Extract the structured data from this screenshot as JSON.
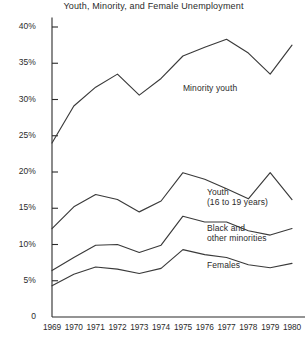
{
  "chart_data": {
    "type": "line",
    "title": "Youth, Minority, and Female Unemployment",
    "xlabel": "",
    "ylabel": "",
    "x": [
      1969,
      1970,
      1971,
      1972,
      1973,
      1974,
      1975,
      1976,
      1977,
      1978,
      1979,
      1980
    ],
    "categories": [
      "1969",
      "1970",
      "1971",
      "1972",
      "1973",
      "1974",
      "1975",
      "1976",
      "1977",
      "1978",
      "1979",
      "1980"
    ],
    "xtick_labels": [
      "1969",
      "1970",
      "1971",
      "1972",
      "1973",
      "1974",
      "1975",
      "1976",
      "1977",
      "1978",
      "1979",
      "1980"
    ],
    "ytick_labels": [
      "0",
      "5%",
      "10%",
      "15%",
      "20%",
      "25%",
      "30%",
      "35%",
      "40%"
    ],
    "ytick_values": [
      0,
      5,
      10,
      15,
      20,
      25,
      30,
      35,
      40
    ],
    "ylim": [
      0,
      41.5
    ],
    "xlim": [
      1968.6,
      1980.4
    ],
    "grid": false,
    "legend": "inline-labels",
    "line_color": "#3a3a3a",
    "axis_color": "#2b2b2b",
    "background": "#ffffff",
    "series": [
      {
        "name": "Minority youth",
        "label": "Minority youth",
        "label_x": 1975.0,
        "label_y": 31.6,
        "values": [
          24.0,
          29.1,
          31.7,
          33.5,
          30.6,
          32.9,
          36.0,
          37.2,
          38.3,
          36.4,
          33.5,
          37.5
        ]
      },
      {
        "name": "Youth (16 to 19 years)",
        "label": "Youth\n(16 to 19 years)",
        "label_line1": "Youth",
        "label_line2": "(16 to 19 years)",
        "label_x": 1976.1,
        "label_y": 16.6,
        "values": [
          12.2,
          15.2,
          16.9,
          16.2,
          14.5,
          16.0,
          19.9,
          19.0,
          17.7,
          16.3,
          19.9,
          16.2
        ]
      },
      {
        "name": "Black and other minorities",
        "label": "Black and\nother minorities",
        "label_line1": "Black and",
        "label_line2": "other minorities",
        "label_x": 1976.1,
        "label_y": 11.6,
        "values": [
          6.4,
          8.2,
          9.9,
          10.0,
          8.9,
          9.9,
          13.9,
          13.1,
          13.1,
          11.9,
          11.3,
          12.2
        ]
      },
      {
        "name": "Females",
        "label": "Females",
        "label_x": 1976.1,
        "label_y": 7.2,
        "values": [
          4.3,
          5.9,
          6.9,
          6.6,
          6.0,
          6.7,
          9.3,
          8.6,
          8.2,
          7.2,
          6.8,
          7.4
        ]
      }
    ]
  }
}
